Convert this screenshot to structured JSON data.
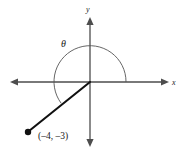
{
  "figure": {
    "type": "coordinate-plane-angle-diagram",
    "background_color": "#ffffff"
  },
  "axes": {
    "x_axis_label": "x",
    "y_axis_label": "y",
    "color": "#4d4d4d",
    "origin": {
      "x": 90,
      "y": 82
    },
    "x_axis": {
      "x_start": 11,
      "x_end": 169,
      "y": 82
    },
    "y_axis": {
      "y_start": 18,
      "y_end": 146,
      "x": 90
    }
  },
  "angle": {
    "symbol": "θ",
    "label_x": 64,
    "label_y": 46,
    "arc_color": "#555555",
    "arc_radius": 36,
    "arc_start_degrees": 0,
    "arc_end_degrees": 216.87,
    "direction": "counterclockwise"
  },
  "terminal_ray": {
    "color": "#111111",
    "width": 2.1,
    "from_x": 90,
    "from_y": 82,
    "to_x": 28,
    "to_y": 132
  },
  "point": {
    "label": "(–4, –3)",
    "x_value": -4,
    "y_value": -3,
    "marker_x": 28,
    "marker_y": 132,
    "marker_radius": 3.2,
    "marker_color": "#111111",
    "label_x": 38,
    "label_y": 139
  }
}
